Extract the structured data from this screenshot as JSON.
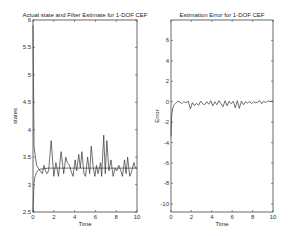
{
  "chart_data": [
    {
      "type": "line",
      "title": "Actual state and Filter Estimate for 1-DOF CEF",
      "xlabel": "Time",
      "ylabel": "states",
      "xlim": [
        0,
        10
      ],
      "ylim": [
        2.5,
        6
      ],
      "xticks": [
        "0",
        "2",
        "4",
        "6",
        "8",
        "10"
      ],
      "yticks": [
        "2.5",
        "3",
        "3.5",
        "4",
        "4.5",
        "5",
        "5.5",
        "6"
      ],
      "grid": false,
      "series": [
        {
          "name": "Actual state",
          "x": [
            0,
            0.1,
            0.2,
            0.35,
            0.5,
            0.7,
            0.9,
            1.05,
            1.2,
            1.35,
            1.5,
            1.75,
            2.0,
            2.2,
            2.45,
            2.7,
            2.95,
            3.15,
            3.3,
            3.5,
            3.65,
            3.85,
            4.05,
            4.2,
            4.4,
            4.55,
            4.7,
            4.9,
            5.05,
            5.25,
            5.45,
            5.6,
            5.8,
            5.95,
            6.1,
            6.25,
            6.5,
            6.6,
            6.8,
            6.95,
            7.1,
            7.3,
            7.5,
            7.7,
            7.9,
            8.05,
            8.25,
            8.45,
            8.6,
            8.8,
            8.95,
            9.1,
            9.3,
            9.5,
            9.7,
            9.85,
            10
          ],
          "y": [
            5.9,
            3.7,
            3.55,
            3.35,
            3.3,
            3.25,
            3.2,
            3.35,
            3.25,
            3.2,
            3.25,
            3.8,
            3.15,
            3.4,
            3.15,
            3.6,
            3.2,
            3.5,
            3.4,
            3.35,
            3.25,
            3.15,
            3.45,
            3.25,
            3.55,
            3.3,
            3.6,
            3.2,
            3.15,
            3.5,
            3.2,
            3.7,
            3.3,
            3.15,
            3.35,
            3.2,
            3.4,
            3.15,
            3.9,
            3.2,
            3.8,
            3.25,
            3.45,
            3.15,
            3.3,
            3.25,
            3.35,
            3.25,
            3.15,
            3.45,
            3.2,
            3.5,
            3.15,
            3.25,
            3.4,
            3.3,
            3.3
          ]
        },
        {
          "name": "Filter Estimate",
          "x": [
            0,
            0.1,
            0.2,
            0.35,
            0.5,
            0.7,
            1.0,
            1.5,
            2,
            4,
            6,
            8,
            10
          ],
          "y": [
            2.5,
            3.05,
            3.15,
            3.22,
            3.26,
            3.28,
            3.29,
            3.3,
            3.3,
            3.3,
            3.3,
            3.3,
            3.3
          ]
        }
      ]
    },
    {
      "type": "line",
      "title": "Estimation Error for 1-DOF CEF",
      "xlabel": "Time",
      "ylabel": "Error",
      "xlim": [
        0,
        10
      ],
      "ylim": [
        -10.8,
        8
      ],
      "xticks": [
        "0",
        "2",
        "4",
        "6",
        "8",
        "10"
      ],
      "yticks": [
        "-10",
        "-8",
        "-6",
        "-4",
        "-2",
        "0",
        "2",
        "4",
        "6"
      ],
      "grid": false,
      "series": [
        {
          "name": "Estimation Error",
          "x": [
            0,
            0.05,
            0.15,
            0.3,
            0.5,
            0.7,
            0.9,
            1.05,
            1.25,
            1.45,
            1.7,
            1.9,
            2.1,
            2.3,
            2.5,
            2.7,
            2.9,
            3.1,
            3.3,
            3.5,
            3.7,
            3.9,
            4.1,
            4.3,
            4.5,
            4.7,
            4.9,
            5.1,
            5.3,
            5.5,
            5.7,
            5.9,
            6.1,
            6.3,
            6.5,
            6.7,
            6.9,
            7.1,
            7.3,
            7.5,
            7.7,
            7.9,
            8.1,
            8.3,
            8.5,
            8.7,
            8.9,
            9.1,
            9.3,
            9.5,
            9.7,
            9.9,
            10
          ],
          "y": [
            -3.4,
            -1.6,
            -0.7,
            -0.3,
            -0.1,
            0.05,
            -0.05,
            -0.2,
            0.0,
            -0.1,
            0.05,
            -0.7,
            -0.1,
            -0.4,
            -0.15,
            -0.35,
            0.05,
            -0.2,
            -0.3,
            0.0,
            -0.25,
            0.1,
            -0.4,
            0.0,
            -0.3,
            0.1,
            -0.2,
            -0.5,
            0.1,
            -0.4,
            0.05,
            -0.2,
            0.05,
            -0.6,
            0.1,
            -0.65,
            0.05,
            -0.3,
            0.0,
            -0.15,
            0.05,
            -0.2,
            0.0,
            -0.1,
            -0.05,
            0.1,
            -0.2,
            0.05,
            -0.1,
            0.1,
            0.0,
            0.05,
            0.05
          ]
        }
      ]
    }
  ],
  "plots": {
    "left": {
      "title": "Actual state and Filter Estimate for 1-DOF CEF",
      "xlabel": "Time",
      "ylabel": "states"
    },
    "right": {
      "title": "Estimation Error for 1-DOF CEF",
      "xlabel": "Time",
      "ylabel": "Error"
    }
  },
  "colors": {
    "line": "#333333",
    "axes": "#444444",
    "background": "#ffffff"
  }
}
